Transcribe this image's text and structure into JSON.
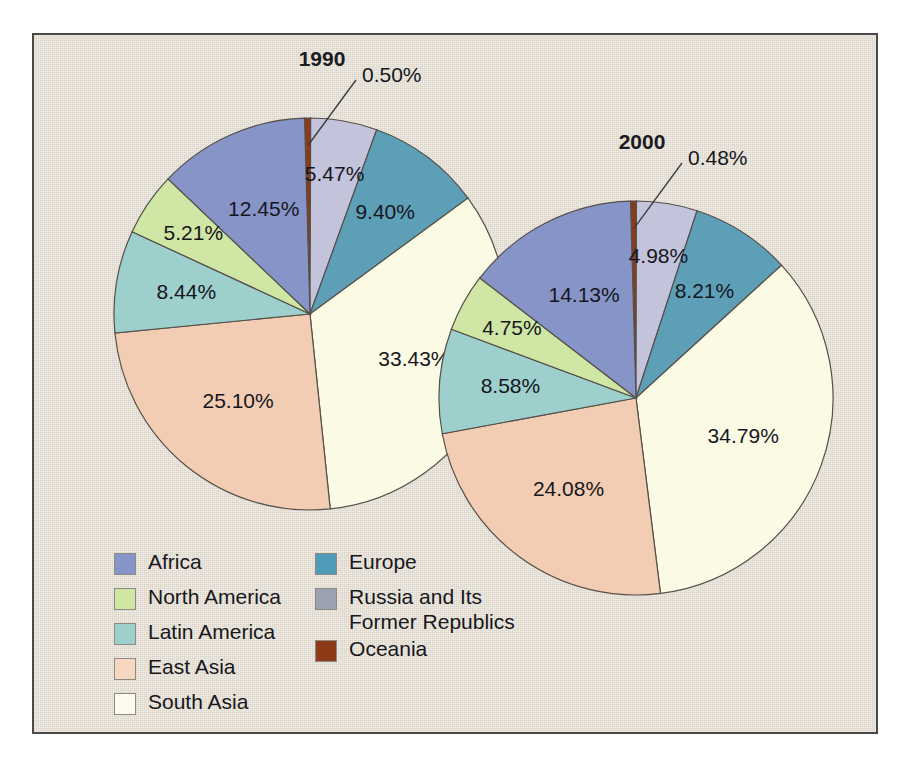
{
  "chart_data": [
    {
      "type": "pie",
      "title": "1990",
      "center": [
        276,
        279
      ],
      "radius": 196,
      "start_angle": -1.6,
      "categories": [
        "Oceania",
        "Russia and Its Former Republics",
        "Europe",
        "South Asia",
        "East Asia",
        "Latin America",
        "North America",
        "Africa"
      ],
      "values": [
        0.5,
        5.47,
        9.4,
        33.43,
        25.1,
        8.44,
        5.21,
        12.45
      ],
      "labels": [
        "0.50%",
        "5.47%",
        "9.40%",
        "33.43%",
        "25.10%",
        "8.44%",
        "5.21%",
        "12.45%"
      ],
      "label_outside": [
        true,
        false,
        false,
        false,
        false,
        false,
        false,
        false
      ],
      "xlabel": "",
      "ylabel": ""
    },
    {
      "type": "pie",
      "title": "2000",
      "center": [
        602,
        363
      ],
      "radius": 197,
      "start_angle": -1.6,
      "categories": [
        "Oceania",
        "Russia and Its Former Republics",
        "Europe",
        "South Asia",
        "East Asia",
        "Latin America",
        "North America",
        "Africa"
      ],
      "values": [
        0.48,
        4.98,
        8.21,
        34.79,
        24.08,
        8.58,
        4.75,
        14.13
      ],
      "labels": [
        "0.48%",
        "4.98%",
        "8.21%",
        "34.79%",
        "24.08%",
        "8.58%",
        "4.75%",
        "14.13%"
      ],
      "label_outside": [
        true,
        false,
        false,
        false,
        false,
        false,
        false,
        false
      ],
      "xlabel": "",
      "ylabel": ""
    }
  ],
  "colors": {
    "Africa": "#8694c8",
    "North America": "#cfe6a4",
    "Latin America": "#9dcfcd",
    "East Asia": "#f2cdb3",
    "South Asia": "#fbfae4",
    "Europe": "#5e9fb8",
    "Russia and Its Former Republics": "#c3c4dc",
    "Oceania": "#8d3a19"
  },
  "legend": {
    "columns": [
      {
        "items": [
          {
            "label": "Africa",
            "color_key": "Africa",
            "swatch": "#8694c8"
          },
          {
            "label": "North America",
            "color_key": "North America",
            "swatch": "#cfe6a4"
          },
          {
            "label": "Latin America",
            "color_key": "Latin America",
            "swatch": "#9dcfcd"
          },
          {
            "label": "East Asia",
            "color_key": "East Asia",
            "swatch": "#f6d7c0"
          },
          {
            "label": "South Asia",
            "color_key": "South Asia",
            "swatch": "#fcfbee"
          }
        ]
      },
      {
        "items": [
          {
            "label": "Europe",
            "color_key": "Europe",
            "swatch": "#4e9cb8"
          },
          {
            "label": "Russia and Its\nFormer Republics",
            "color_key": "Russia and Its Former Republics",
            "swatch": "#9aa2af",
            "two_line": true
          },
          {
            "label": "Oceania",
            "color_key": "Oceania",
            "swatch": "#8d3a19"
          }
        ]
      }
    ]
  },
  "style": {
    "panel_background": "#e8e2d8",
    "panel_border": "#4a4a46",
    "text_color": "#16161d",
    "slice_outline": "#555049"
  }
}
